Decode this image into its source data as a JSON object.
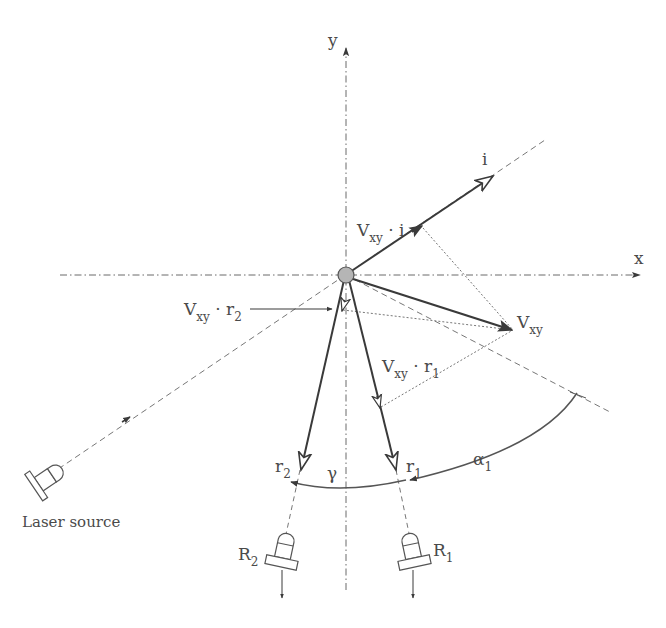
{
  "diagram": {
    "type": "laser-doppler-geometry",
    "colors": {
      "line": "#3a3a3a",
      "axis": "#6a6a6a",
      "dotted": "#777777",
      "origin_fill": "#b5b5b5",
      "text": "#4a4a4a"
    },
    "axes": {
      "x_label": "x",
      "y_label": "y"
    },
    "vectors": {
      "incident": {
        "label": "i"
      },
      "velocity": {
        "label_main": "V",
        "label_sub": "xy"
      },
      "r1": {
        "label_main": "r",
        "label_sub": "1"
      },
      "r2": {
        "label_main": "r",
        "label_sub": "2"
      }
    },
    "projections": {
      "v_dot_i": {
        "main": "V",
        "sub": "xy",
        "op": " · ",
        "vec": "i",
        "vec_sub": ""
      },
      "v_dot_r1": {
        "main": "V",
        "sub": "xy",
        "op": " · ",
        "vec": "r",
        "vec_sub": "1"
      },
      "v_dot_r2": {
        "main": "V",
        "sub": "xy",
        "op": " · ",
        "vec": "r",
        "vec_sub": "2"
      }
    },
    "angles": {
      "alpha1": {
        "main": "α",
        "sub": "1"
      },
      "gamma": {
        "main": "γ"
      }
    },
    "devices": {
      "laser": {
        "label": "Laser source"
      },
      "receiver1": {
        "main": "R",
        "sub": "1"
      },
      "receiver2": {
        "main": "R",
        "sub": "2"
      }
    }
  }
}
